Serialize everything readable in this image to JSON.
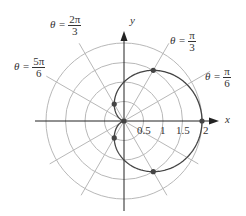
{
  "chart_data": {
    "type": "polar-line",
    "title": "",
    "equation": "r = 1 + cos θ",
    "xlabel": "x",
    "ylabel": "y",
    "radial_ticks": [
      0.5,
      1,
      1.5,
      2
    ],
    "radial_tick_labels": [
      "0.5",
      "1",
      "1.5",
      "2"
    ],
    "grid": {
      "circles": [
        0.5,
        1,
        1.5,
        2
      ],
      "radial_line_step_deg": 30
    },
    "angle_annotations": [
      {
        "label": "θ = 2π/3",
        "numerator": "2π",
        "denominator": "3",
        "angle_deg": 120
      },
      {
        "label": "θ = π/3",
        "numerator": "π",
        "denominator": "3",
        "angle_deg": 60
      },
      {
        "label": "θ = 5π/6",
        "numerator": "5π",
        "denominator": "6",
        "angle_deg": 150
      },
      {
        "label": "θ = π/6",
        "numerator": "π",
        "denominator": "6",
        "angle_deg": 30
      }
    ],
    "marked_points": [
      {
        "theta": "0",
        "r": 2,
        "x": 2,
        "y": 0
      },
      {
        "theta": "π/3",
        "r": 1.5,
        "x": 0.75,
        "y": 1.299
      },
      {
        "theta": "2π/3",
        "r": 0.5,
        "x": -0.25,
        "y": 0.433
      },
      {
        "theta": "π",
        "r": 0,
        "x": 0,
        "y": 0
      },
      {
        "theta": "4π/3",
        "r": 0.5,
        "x": -0.25,
        "y": -0.433
      },
      {
        "theta": "5π/3",
        "r": 1.5,
        "x": 0.75,
        "y": -1.299
      }
    ],
    "xlim": [
      -2.2,
      2.3
    ],
    "ylim": [
      -2.2,
      2.3
    ],
    "colors": {
      "curve": "#444444",
      "grid": "#b8b8b8",
      "axes": "#222222",
      "points": "#444444"
    }
  },
  "labels": {
    "theta_symbol": "θ =",
    "a120_num": "2π",
    "a120_den": "3",
    "a60_num": "π",
    "a60_den": "3",
    "a150_num": "5π",
    "a150_den": "6",
    "a30_num": "π",
    "a30_den": "6",
    "x_axis": "x",
    "y_axis": "y",
    "tick_05": "0.5",
    "tick_1": "1",
    "tick_15": "1.5",
    "tick_2": "2"
  }
}
